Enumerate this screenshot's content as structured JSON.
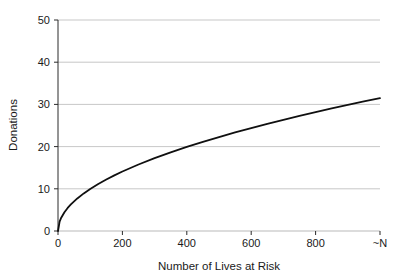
{
  "chart_data": {
    "type": "line",
    "title": "",
    "subtitle": "",
    "xlabel": "Number of Lives at Risk",
    "ylabel": "Donations",
    "xlim": [
      0,
      1000
    ],
    "ylim": [
      0,
      50
    ],
    "grid": true,
    "legend": null,
    "legend_position": "none",
    "x_tick_values": [
      0,
      200,
      400,
      600,
      800,
      1000
    ],
    "x_tick_labels": [
      "0",
      "200",
      "400",
      "600",
      "800",
      "~N"
    ],
    "y_tick_values": [
      0,
      10,
      20,
      30,
      40,
      50
    ],
    "y_tick_labels": [
      "0",
      "10",
      "20",
      "30",
      "40",
      "50"
    ],
    "series": [
      {
        "name": "Donations",
        "color": "#101010",
        "line_width": 1.8,
        "x": [
          0,
          5,
          10,
          20,
          30,
          40,
          60,
          80,
          100,
          125,
          150,
          175,
          200,
          250,
          300,
          350,
          400,
          450,
          500,
          550,
          600,
          650,
          700,
          750,
          800,
          850,
          900,
          950,
          1000
        ],
        "values": [
          0,
          2.23,
          3.15,
          4.45,
          5.46,
          6.3,
          7.72,
          8.91,
          9.96,
          11.14,
          12.2,
          13.18,
          14.09,
          15.75,
          17.26,
          18.64,
          19.92,
          21.13,
          22.27,
          23.36,
          24.4,
          25.4,
          26.36,
          27.28,
          28.18,
          29.05,
          29.89,
          30.71,
          31.5
        ]
      }
    ],
    "annotations": []
  },
  "axes": {
    "y_axis_label": "Donations",
    "x_axis_label": "Number of Lives at Risk"
  }
}
